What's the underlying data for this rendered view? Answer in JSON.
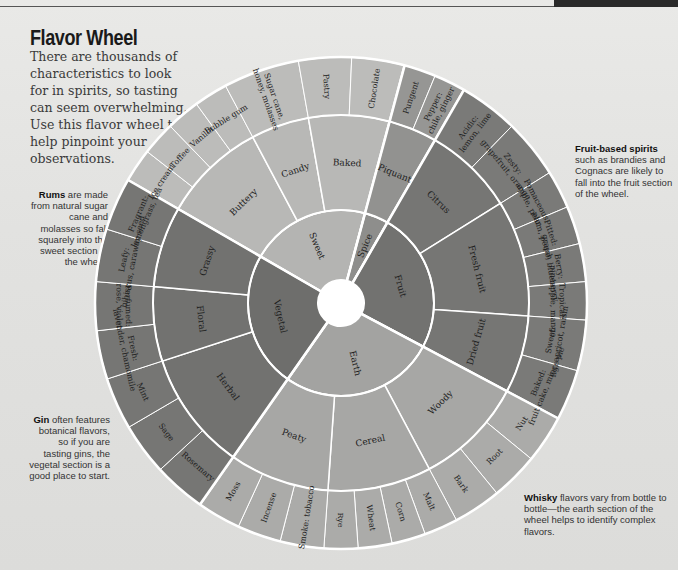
{
  "header": {
    "title": "Flavor Wheel",
    "intro": "There are thousands of characteristics to look for in spirits, so tasting can seem overwhelming. Use this flavor wheel to help pinpoint your observations."
  },
  "notes": {
    "rums": {
      "bold": "Rums",
      "text": " are made from natural sugar cane and molasses so fall squarely into the sweet section of the wheel."
    },
    "gin": {
      "bold": "Gin",
      "text": " often features botanical flavors, so if you are tasting gins, the vegetal section is a good place to start."
    },
    "fruit": {
      "bold": "Fruit-based spirits",
      "text": " such as brandies and Cognacs are likely to fall into the fruit section of the wheel."
    },
    "whisky": {
      "bold": "Whisky",
      "text": " flavors vary from bottle to bottle—the earth section of the wheel helps to identify complex flavors."
    }
  },
  "wheel": {
    "center": [
      341,
      303
    ],
    "radii": {
      "hole": 23,
      "inner": 93,
      "middle": 188,
      "outer": 246
    },
    "categories": [
      {
        "name": "Sweet",
        "start": -60,
        "end": 15,
        "color": "#b4b4b2",
        "subs": [
          {
            "name": "Buttery",
            "start": -60,
            "end": -28,
            "items": [
              "Ice cream",
              "Toffee",
              "Vanilla",
              "Bubble gum"
            ]
          },
          {
            "name": "Candy",
            "start": -28,
            "end": -10,
            "items": [
              "Sugar cane, honey, molasses"
            ]
          },
          {
            "name": "Baked",
            "start": -10,
            "end": 15,
            "items": [
              "Pastry",
              "Chocolate"
            ]
          }
        ]
      },
      {
        "name": "Spice",
        "start": 15,
        "end": 30,
        "color": "#8e8e8c",
        "subs": [
          {
            "name": "Piquant",
            "start": 15,
            "end": 30,
            "items": [
              "Pungent",
              "Pepper: chile, ginger"
            ]
          }
        ]
      },
      {
        "name": "Fruit",
        "start": 30,
        "end": 118,
        "color": "#727270",
        "subs": [
          {
            "name": "Citrus",
            "start": 30,
            "end": 58,
            "items": [
              "Acidic: lemon, lime",
              "Zesty: grapefruit, orange"
            ]
          },
          {
            "name": "Fresh fruit",
            "start": 58,
            "end": 94,
            "items": [
              "Pomaceous: apple, pear",
              "Pitted: plum, peach",
              "Berry: grape, blueberry",
              "Tropical: pineapple, mango"
            ]
          },
          {
            "name": "Dried fruit",
            "start": 94,
            "end": 118,
            "items": [
              "Sweet: fig, apricot, raisin",
              "Baked: fruit cake, mince pie"
            ]
          }
        ]
      },
      {
        "name": "Earth",
        "start": 118,
        "end": 215,
        "color": "#a3a3a1",
        "subs": [
          {
            "name": "Woody",
            "start": 118,
            "end": 152,
            "items": [
              "Nut",
              "Root",
              "Bark"
            ]
          },
          {
            "name": "Cereal",
            "start": 152,
            "end": 184,
            "items": [
              "Malt",
              "Corn",
              "Wheat",
              "Rye"
            ]
          },
          {
            "name": "Peaty",
            "start": 184,
            "end": 215,
            "items": [
              "Smoke: tobacco",
              "Incense",
              "Moss"
            ]
          }
        ]
      },
      {
        "name": "Vegetal",
        "start": 215,
        "end": 300,
        "color": "#6e6e6c",
        "subs": [
          {
            "name": "Herbal",
            "start": 215,
            "end": 252,
            "items": [
              "Rosemary",
              "Sage",
              "Mint"
            ]
          },
          {
            "name": "Floral",
            "start": 252,
            "end": 275,
            "items": [
              "Fresh: lavender, chamomile",
              "Perfumed: rose, violet"
            ]
          },
          {
            "name": "Grassy",
            "start": 275,
            "end": 300,
            "items": [
              "Leafy: hibiscus, caraway seed",
              "Fragrant: lemongrass, tea"
            ]
          }
        ]
      }
    ]
  }
}
